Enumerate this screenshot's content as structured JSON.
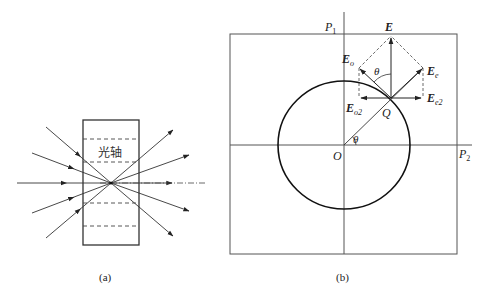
{
  "figure_a": {
    "caption": "(a)",
    "crystal_label": "光轴",
    "crystal_box": {
      "x": 83,
      "y": 120,
      "width": 56,
      "height": 125
    },
    "dashed_lines_y": [
      139,
      162,
      203,
      226
    ],
    "focus_point": {
      "x": 111,
      "y": 183
    },
    "incoming_rays": [
      {
        "x1": 46,
        "y1": 127
      },
      {
        "x1": 32,
        "y1": 153
      },
      {
        "x1": 17,
        "y1": 183
      },
      {
        "x1": 32,
        "y1": 213
      },
      {
        "x1": 46,
        "y1": 238
      }
    ],
    "outgoing_rays": [
      {
        "x2": 173,
        "y2": 130
      },
      {
        "x2": 189,
        "y2": 155
      },
      {
        "x2": 172,
        "y2": 183
      },
      {
        "x2": 189,
        "y2": 211
      },
      {
        "x2": 173,
        "y2": 236
      }
    ],
    "axis_dashdot_end_x": 207
  },
  "figure_b": {
    "caption": "(b)",
    "frame": {
      "x": 230,
      "y": 34,
      "width": 227,
      "height": 220
    },
    "origin": {
      "x": 344,
      "y": 145
    },
    "circle": {
      "rx": 66,
      "ry": 64
    },
    "Q": {
      "x": 391,
      "y": 98
    },
    "labels": {
      "P1": "P",
      "P1_sub": "1",
      "P2": "P",
      "P2_sub": "2",
      "O": "O",
      "Q": "Q",
      "theta_origin": "θ",
      "theta_top": "θ",
      "E": "E",
      "Eo": "E",
      "Eo_sub": "o",
      "Ee": "E",
      "Ee_sub": "e",
      "Eo2": "E",
      "Eo2_sub": "o2",
      "Ee2": "E",
      "Ee2_sub": "e2"
    },
    "vectors": {
      "E_tip": {
        "x": 391,
        "y": 36
      },
      "Eo_tip": {
        "x": 359,
        "y": 68
      },
      "Ee_tip": {
        "x": 423,
        "y": 68
      },
      "Eo2_tip": {
        "x": 359,
        "y": 98
      },
      "Ee2_tip": {
        "x": 423,
        "y": 98
      }
    }
  },
  "colors": {
    "line": "#333333",
    "frame": "#555555",
    "circle": "#111111"
  }
}
